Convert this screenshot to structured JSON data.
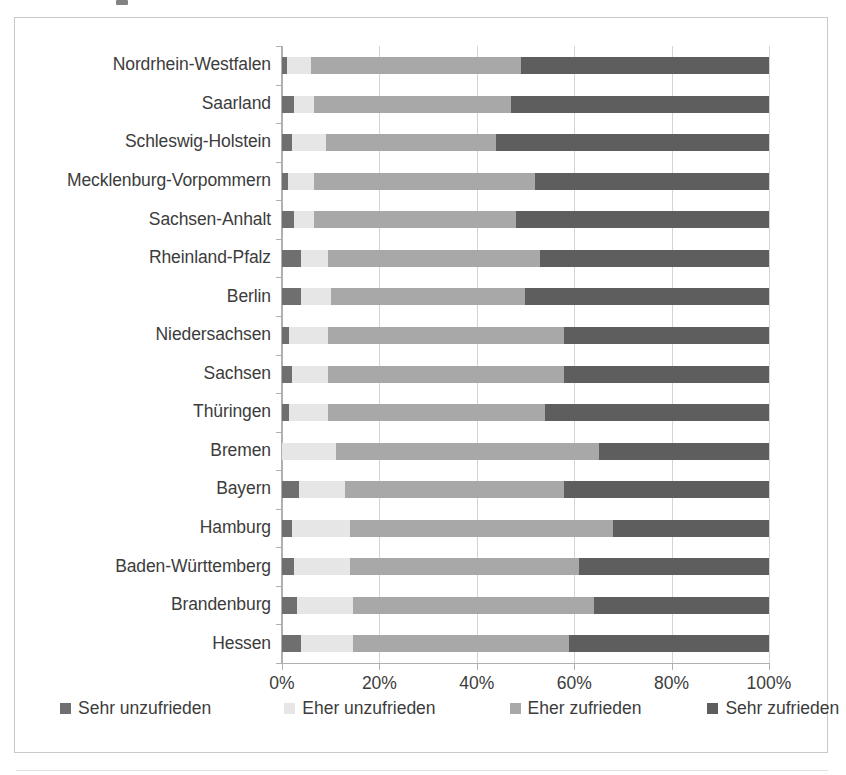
{
  "chart_data": {
    "type": "bar",
    "orientation": "horizontal",
    "stacked": true,
    "normalized": "100%",
    "title": "",
    "xlabel": "",
    "ylabel": "",
    "xlim": [
      0,
      100
    ],
    "xticks": [
      "0%",
      "20%",
      "40%",
      "60%",
      "80%",
      "100%"
    ],
    "xtick_values": [
      0,
      20,
      40,
      60,
      80,
      100
    ],
    "grid": "vertical",
    "legend_position": "bottom",
    "legend": [
      "Sehr unzufrieden",
      "Eher unzufrieden",
      "Eher zufrieden",
      "Sehr zufrieden"
    ],
    "categories": [
      "Nordrhein-Westfalen",
      "Saarland",
      "Schleswig-Holstein",
      "Mecklenburg-Vorpommern",
      "Sachsen-Anhalt",
      "Rheinland-Pfalz",
      "Berlin",
      "Niedersachsen",
      "Sachsen",
      "Thüringen",
      "Bremen",
      "Bayern",
      "Hamburg",
      "Baden-Württemberg",
      "Brandenburg",
      "Hessen"
    ],
    "series": [
      {
        "name": "Sehr unzufrieden",
        "color": "#6f6f6f",
        "values": [
          1.0,
          2.5,
          2.0,
          1.2,
          2.5,
          4.0,
          4.0,
          1.5,
          2.0,
          1.5,
          0.0,
          3.5,
          2.0,
          2.5,
          3.0,
          4.0
        ]
      },
      {
        "name": "Eher unzufrieden",
        "color": "#e6e6e6",
        "values": [
          5.0,
          4.0,
          7.0,
          5.3,
          4.0,
          5.5,
          6.0,
          8.0,
          7.5,
          8.0,
          11.0,
          9.5,
          12.0,
          11.5,
          11.5,
          10.5
        ]
      },
      {
        "name": "Eher zufrieden",
        "color": "#a8a8a8",
        "values": [
          43.0,
          40.5,
          35.0,
          45.5,
          41.5,
          43.5,
          40.0,
          48.5,
          48.5,
          44.5,
          54.0,
          45.0,
          54.0,
          47.0,
          49.5,
          44.5
        ]
      },
      {
        "name": "Sehr zufrieden",
        "color": "#5e5e5e",
        "values": [
          51.0,
          53.0,
          56.0,
          48.0,
          52.0,
          47.0,
          50.0,
          42.0,
          42.0,
          46.0,
          35.0,
          42.0,
          32.0,
          39.0,
          36.0,
          41.0
        ]
      }
    ]
  },
  "axis": {
    "x_tick_labels": [
      "0%",
      "20%",
      "40%",
      "60%",
      "80%",
      "100%"
    ]
  },
  "legend": {
    "items": [
      {
        "label": "Sehr unzufrieden",
        "color": "#6f6f6f"
      },
      {
        "label": "Eher unzufrieden",
        "color": "#e6e6e6"
      },
      {
        "label": "Eher zufrieden",
        "color": "#a8a8a8"
      },
      {
        "label": "Sehr zufrieden",
        "color": "#5e5e5e"
      }
    ]
  }
}
